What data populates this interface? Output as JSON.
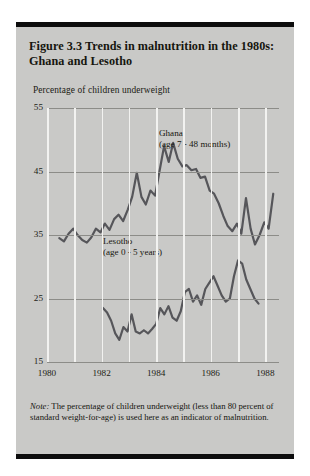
{
  "figure": {
    "title": "Figure 3.3  Trends in malnutrition in the 1980s: Ghana and Lesotho",
    "axis_label": "Percentage of children underweight",
    "note_label": "Note:",
    "note_text": "  The percentage of children underweight (less than 80 percent of standard weight-for-age) is used here as an indicator of malnutrition.",
    "background_color": "#c9c9c7",
    "rule_color": "#0d0d0d",
    "line_color": "#56565a",
    "gridline_color": "#f2f2f0",
    "hline_color": "#8c8c88"
  },
  "chart_data": {
    "type": "line",
    "title": "Figure 3.3  Trends in malnutrition in the 1980s: Ghana and Lesotho",
    "xlabel": "",
    "ylabel": "Percentage of children underweight",
    "ylim": [
      15,
      55
    ],
    "xlim": [
      1980,
      1988.5
    ],
    "yticks": [
      55,
      45,
      35,
      25,
      15
    ],
    "xticks": [
      1980,
      1982,
      1984,
      1986,
      1988
    ],
    "gridlines_vertical": [
      1980,
      1981,
      1982,
      1983,
      1984,
      1985,
      1986,
      1987,
      1988
    ],
    "grid": true,
    "legend": "inline-annotations",
    "annotations": [
      {
        "text": "Ghana",
        "subtext": "(age 7 - 48 months)",
        "x": 1984.7,
        "y": 48.5
      },
      {
        "text": "Lesotho",
        "subtext": "(age 0 - 5 years)",
        "x": 1982.2,
        "y": 29.5
      }
    ],
    "series": [
      {
        "name": "Ghana",
        "detail": "(age 7 - 48 months)",
        "x": [
          1980.45,
          1980.62,
          1980.79,
          1980.96,
          1981.12,
          1981.29,
          1981.46,
          1981.62,
          1981.79,
          1981.96,
          1982.12,
          1982.29,
          1982.46,
          1982.62,
          1982.79,
          1982.96,
          1983.12,
          1983.29,
          1983.46,
          1983.62,
          1983.79,
          1983.96,
          1984.12,
          1984.29,
          1984.46,
          1984.62,
          1984.79,
          1984.96,
          1985.12,
          1985.29,
          1985.46,
          1985.62,
          1985.79,
          1985.96,
          1986.12,
          1986.29,
          1986.46,
          1986.62,
          1986.79,
          1986.96,
          1987.12,
          1987.29,
          1987.46,
          1987.62,
          1987.79,
          1987.96,
          1988.12,
          1988.29
        ],
        "y": [
          34.5,
          34.0,
          35.2,
          36.0,
          35.0,
          34.2,
          33.8,
          34.6,
          36.0,
          35.4,
          36.8,
          35.8,
          37.5,
          38.2,
          37.2,
          39.0,
          41.0,
          44.8,
          41.0,
          39.8,
          42.0,
          41.2,
          45.0,
          49.0,
          46.5,
          49.5,
          47.0,
          45.8,
          46.0,
          45.2,
          45.4,
          44.0,
          44.2,
          42.0,
          41.5,
          40.0,
          38.0,
          36.4,
          35.6,
          36.8,
          35.2,
          40.8,
          36.0,
          33.5,
          35.0,
          37.0,
          36.0,
          41.5
        ]
      },
      {
        "name": "Lesotho",
        "detail": "(age 0 - 5 years)",
        "x": [
          1982.05,
          1982.2,
          1982.35,
          1982.5,
          1982.65,
          1982.8,
          1982.95,
          1983.1,
          1983.25,
          1983.4,
          1983.55,
          1983.7,
          1983.85,
          1984.0,
          1984.15,
          1984.3,
          1984.45,
          1984.6,
          1984.75,
          1984.9,
          1985.05,
          1985.2,
          1985.35,
          1985.5,
          1985.65,
          1985.8,
          1985.95,
          1986.1,
          1986.25,
          1986.4,
          1986.55,
          1986.7,
          1986.85,
          1987.0,
          1987.15,
          1987.3,
          1987.45,
          1987.6,
          1987.75
        ],
        "y": [
          23.5,
          22.8,
          21.5,
          19.5,
          18.5,
          20.5,
          19.8,
          22.5,
          19.8,
          19.5,
          20.0,
          19.5,
          20.2,
          21.0,
          23.5,
          22.5,
          23.8,
          22.0,
          21.5,
          23.0,
          26.0,
          26.5,
          24.5,
          25.5,
          24.0,
          26.5,
          27.5,
          28.5,
          27.0,
          25.5,
          24.5,
          25.0,
          28.5,
          31.0,
          30.5,
          28.0,
          26.5,
          25.0,
          24.2
        ]
      }
    ]
  }
}
